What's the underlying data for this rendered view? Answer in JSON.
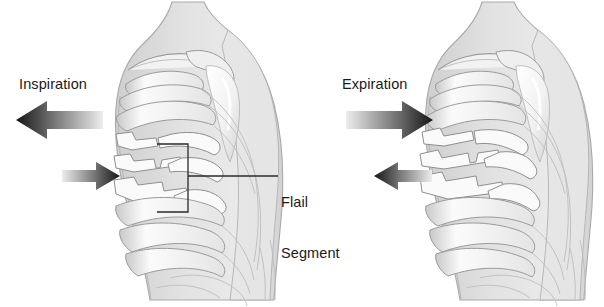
{
  "figure": {
    "type": "medical-illustration",
    "background_color": "#ffffff",
    "panels": [
      {
        "id": "left",
        "phase_label": "Inspiration",
        "main_arrow": {
          "name": "inspiration-arrow",
          "direction": "left",
          "meaning": "chest wall moves outward / air in"
        },
        "segment_arrow": {
          "name": "flail-segment-inward-arrow",
          "direction": "right",
          "meaning": "flail segment moves inward"
        },
        "callout": {
          "bracket": true,
          "leader_line": true
        }
      },
      {
        "id": "right",
        "phase_label": "Expiration",
        "main_arrow": {
          "name": "expiration-arrow",
          "direction": "right",
          "meaning": "chest wall moves inward / air out"
        },
        "segment_arrow": {
          "name": "flail-segment-outward-arrow",
          "direction": "left",
          "meaning": "flail segment moves outward"
        },
        "callout": {
          "bracket": false,
          "leader_line": false
        }
      }
    ],
    "annotation": {
      "name": "flail-segment-callout",
      "line1": "Flail",
      "line2": "Segment"
    },
    "colors": {
      "body_fill": "#dcdcdc",
      "body_edge": "#a9a9a9",
      "rib_fill": "#f4f4f4",
      "rib_edge": "#9b9b9b",
      "rib_shadow": "#c4c4c4",
      "arrow_dark": "#1c1c1c",
      "arrow_light": "#e8e8e8",
      "callout_line": "#2a2a2a",
      "text": "#1a1a1a"
    }
  }
}
